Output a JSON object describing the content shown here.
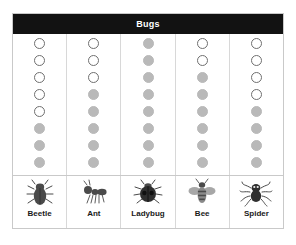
{
  "header": {
    "title": "Bugs"
  },
  "colors": {
    "title_bar_bg": "#121212",
    "title_text": "#ffffff",
    "frame_border": "#c9c9c9",
    "grid_line": "#d8d8d8",
    "dot_open_fill": "#ffffff",
    "dot_open_stroke": "#6f6f6f",
    "dot_filled": "#b9b9b9",
    "icon_dark": "#4a4a4a",
    "icon_mid": "#8a8a8a",
    "label_text": "#1a1a1a"
  },
  "chart_data": {
    "type": "bar",
    "title": "Bugs",
    "subtitle": "",
    "xlabel": "",
    "ylabel": "",
    "categories": [
      "Beetle",
      "Ant",
      "Ladybug",
      "Bee",
      "Spider"
    ],
    "values": [
      5,
      3,
      0,
      2,
      4
    ],
    "series": [
      {
        "name": "Open circles",
        "values": [
          5,
          3,
          0,
          2,
          4
        ]
      },
      {
        "name": "Filled circles",
        "values": [
          3,
          5,
          8,
          6,
          4
        ]
      }
    ],
    "total_per_column": 8,
    "ylim": [
      0,
      8
    ],
    "grid": false,
    "legend_position": "bottom"
  },
  "columns": [
    {
      "label": "Beetle",
      "icon": "beetle-icon",
      "open_count": 5,
      "filled_count": 3,
      "dots": [
        "open",
        "open",
        "open",
        "open",
        "open",
        "filled",
        "filled",
        "filled"
      ]
    },
    {
      "label": "Ant",
      "icon": "ant-icon",
      "open_count": 3,
      "filled_count": 5,
      "dots": [
        "open",
        "open",
        "open",
        "filled",
        "filled",
        "filled",
        "filled",
        "filled"
      ]
    },
    {
      "label": "Ladybug",
      "icon": "ladybug-icon",
      "open_count": 0,
      "filled_count": 8,
      "dots": [
        "filled",
        "filled",
        "filled",
        "filled",
        "filled",
        "filled",
        "filled",
        "filled"
      ]
    },
    {
      "label": "Bee",
      "icon": "bee-icon",
      "open_count": 2,
      "filled_count": 6,
      "dots": [
        "open",
        "open",
        "filled",
        "filled",
        "filled",
        "filled",
        "filled",
        "filled"
      ]
    },
    {
      "label": "Spider",
      "icon": "spider-icon",
      "open_count": 4,
      "filled_count": 4,
      "dots": [
        "open",
        "open",
        "open",
        "open",
        "filled",
        "filled",
        "filled",
        "filled"
      ]
    }
  ]
}
